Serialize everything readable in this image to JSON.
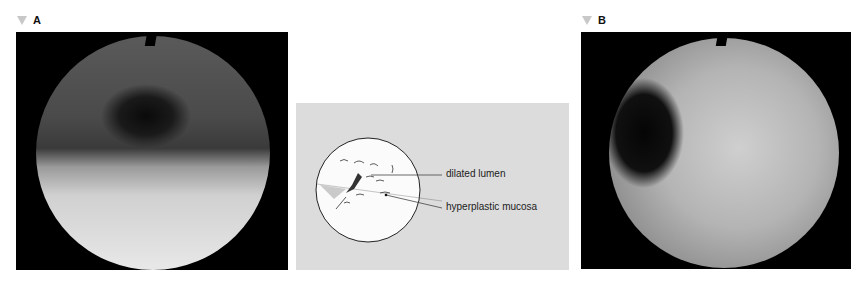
{
  "figure": {
    "panels": [
      {
        "id": "A",
        "label": "A",
        "type": "endoscopic-photo"
      },
      {
        "id": "diagram",
        "type": "line-drawing",
        "annotations": [
          {
            "text": "dilated lumen"
          },
          {
            "text": "hyperplastic mucosa"
          }
        ]
      },
      {
        "id": "B",
        "label": "B",
        "type": "endoscopic-photo"
      }
    ],
    "colors": {
      "marker": "#c8c8c8",
      "diagram_bg": "#dcdcdc",
      "photo_bg": "#000000"
    }
  }
}
